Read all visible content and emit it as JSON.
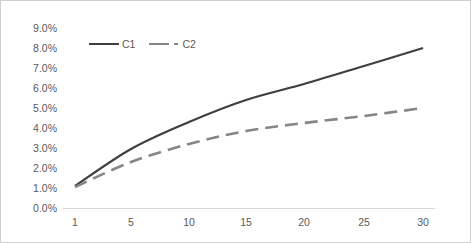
{
  "chart_data": {
    "type": "line",
    "title": "",
    "subtitle": "",
    "xlabel": "",
    "ylabel": "",
    "x": [
      1,
      5,
      10,
      15,
      20,
      25,
      30
    ],
    "xtick_labels": [
      "1",
      "5",
      "10",
      "15",
      "20",
      "25",
      "30"
    ],
    "ytick_labels": [
      "0.0%",
      "1.0%",
      "2.0%",
      "3.0%",
      "4.0%",
      "5.0%",
      "6.0%",
      "7.0%",
      "8.0%",
      "9.0%"
    ],
    "ytick_values": [
      0.0,
      1.0,
      2.0,
      3.0,
      4.0,
      5.0,
      6.0,
      7.0,
      8.0,
      9.0
    ],
    "ylim": [
      0.0,
      9.0
    ],
    "xlim": [
      1,
      30
    ],
    "grid": false,
    "legend_position": "top-left-inside",
    "series": [
      {
        "name": "C1",
        "style": "solid",
        "color": "#3f3f3f",
        "values": [
          1.1,
          2.95,
          4.3,
          5.4,
          6.2,
          7.1,
          8.0
        ]
      },
      {
        "name": "C2",
        "style": "dashed",
        "color": "#868686",
        "values": [
          1.05,
          2.3,
          3.2,
          3.85,
          4.25,
          4.6,
          5.0
        ]
      }
    ]
  },
  "legend": {
    "entries": [
      {
        "label": "C1"
      },
      {
        "label": "C2"
      }
    ]
  }
}
